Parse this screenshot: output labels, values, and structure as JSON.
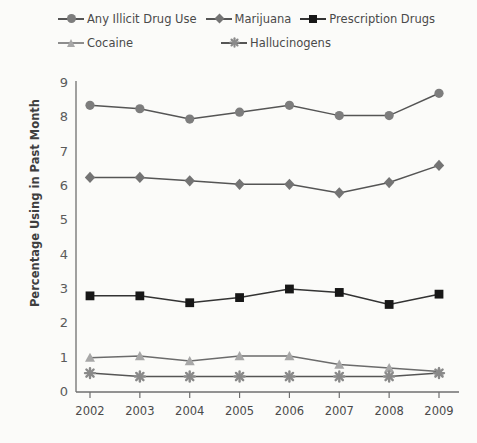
{
  "chart_data": {
    "type": "line",
    "title": "",
    "xlabel": "",
    "ylabel": "Percentage Using in Past Month",
    "categories": [
      "2002",
      "2003",
      "2004",
      "2005",
      "2006",
      "2007",
      "2008",
      "2009"
    ],
    "x": [
      2002,
      2003,
      2004,
      2005,
      2006,
      2007,
      2008,
      2009
    ],
    "ylim": [
      0,
      9
    ],
    "yticks": [
      0,
      1,
      2,
      3,
      4,
      5,
      6,
      7,
      8,
      9
    ],
    "grid": false,
    "legend_position": "top",
    "series": [
      {
        "name": "Any Illicit Drug Use",
        "marker": "circle",
        "color": "#7d7d7d",
        "line_color": "#555555",
        "values": [
          8.35,
          8.25,
          7.95,
          8.15,
          8.35,
          8.05,
          8.05,
          8.7
        ]
      },
      {
        "name": "Marijuana",
        "marker": "diamond",
        "color": "#747474",
        "line_color": "#555555",
        "values": [
          6.25,
          6.25,
          6.15,
          6.05,
          6.05,
          5.8,
          6.1,
          6.6
        ]
      },
      {
        "name": "Prescription Drugs",
        "marker": "square",
        "color": "#171717",
        "line_color": "#333333",
        "values": [
          2.8,
          2.8,
          2.6,
          2.75,
          3.0,
          2.9,
          2.55,
          2.85
        ]
      },
      {
        "name": "Cocaine",
        "marker": "triangle",
        "color": "#a7a7a7",
        "line_color": "#6b6b6b",
        "values": [
          1.0,
          1.05,
          0.9,
          1.05,
          1.05,
          0.8,
          0.7,
          0.6
        ]
      },
      {
        "name": "Hallucinogens",
        "marker": "asterisk",
        "color": "#8a8a8a",
        "line_color": "#555555",
        "values": [
          0.55,
          0.45,
          0.45,
          0.45,
          0.45,
          0.45,
          0.45,
          0.55
        ]
      }
    ]
  },
  "legend": {
    "row1": [
      "Any Illicit Drug Use",
      "Marijuana",
      "Prescription Drugs"
    ],
    "row2": [
      "Cocaine",
      "Hallucinogens"
    ]
  },
  "axis": {
    "y_label": "Percentage Using in Past Month",
    "y_ticks": [
      "9",
      "8",
      "7",
      "6",
      "5",
      "4",
      "3",
      "2",
      "1",
      "0"
    ],
    "x_ticks": [
      "2002",
      "2003",
      "2004",
      "2005",
      "2006",
      "2007",
      "2008",
      "2009"
    ]
  },
  "colors": {
    "background": "#fbfbf9",
    "axis": "#6f6f6f",
    "text": "#4a4a4a",
    "any_illicit": "#7d7d7d",
    "marijuana": "#747474",
    "prescription": "#171717",
    "cocaine": "#a7a7a7",
    "hallucinogens": "#8a8a8a"
  }
}
